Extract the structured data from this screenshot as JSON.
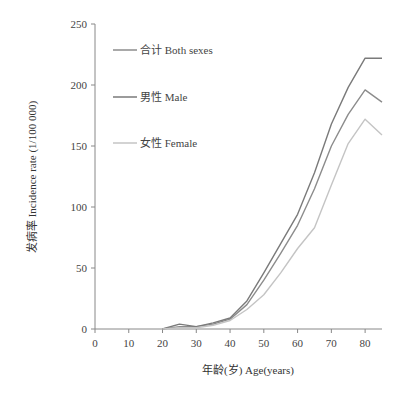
{
  "chart_data": {
    "type": "line",
    "title": "",
    "xlabel": "年龄(岁) Age(years)",
    "ylabel": "发病率 Incidence  rate (1/100 000)",
    "xlim": [
      0,
      85
    ],
    "ylim": [
      0,
      250
    ],
    "x_ticks": [
      0,
      10,
      20,
      30,
      40,
      50,
      60,
      70,
      80
    ],
    "y_ticks": [
      0,
      50,
      100,
      150,
      200,
      250
    ],
    "grid": false,
    "legend_position": "upper-left",
    "x": [
      20,
      25,
      30,
      35,
      40,
      45,
      50,
      55,
      60,
      65,
      70,
      75,
      80,
      85
    ],
    "series": [
      {
        "name": "合计 Both sexes",
        "color": "#8c8c8c",
        "values": [
          0,
          2,
          2,
          4,
          8,
          20,
          40,
          62,
          85,
          115,
          150,
          176,
          196,
          186
        ]
      },
      {
        "name": "男性 Male",
        "color": "#7a7a7a",
        "values": [
          0,
          4,
          2,
          5,
          9,
          23,
          46,
          70,
          94,
          128,
          168,
          198,
          222,
          222
        ]
      },
      {
        "name": "女性 Female",
        "color": "#c4c4c4",
        "values": [
          0,
          1,
          1,
          3,
          7,
          16,
          28,
          46,
          66,
          83,
          118,
          152,
          172,
          159
        ]
      }
    ]
  },
  "legend": {
    "items": [
      {
        "label": "合计 Both sexes",
        "color": "#8c8c8c"
      },
      {
        "label": "男性 Male",
        "color": "#7a7a7a"
      },
      {
        "label": "女性 Female",
        "color": "#c4c4c4"
      }
    ]
  },
  "axes": {
    "x_title": "年龄(岁) Age(years)",
    "y_title": "发病率 Incidence  rate (1/100 000)"
  }
}
